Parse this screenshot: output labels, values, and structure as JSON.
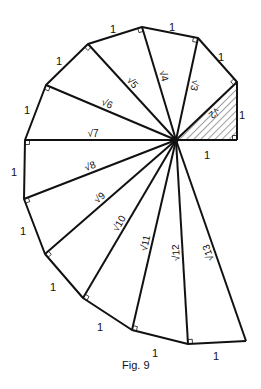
{
  "caption": "Fig. 9",
  "colors": {
    "ink": "#111111",
    "background": "#ffffff"
  },
  "diagram": {
    "type": "spiral-of-theodorus",
    "center": [
      176,
      140
    ],
    "vertices": [
      [
        237,
        140
      ],
      [
        237,
        82
      ],
      [
        198,
        38
      ],
      [
        142,
        27
      ],
      [
        88,
        44
      ],
      [
        46,
        85
      ],
      [
        25,
        140
      ],
      [
        24,
        199
      ],
      [
        45,
        254
      ],
      [
        83,
        298
      ],
      [
        132,
        330
      ],
      [
        188,
        344
      ],
      [
        246,
        341
      ]
    ],
    "hypotenuse_labels": [
      "√2",
      "√3",
      "√4",
      "√5",
      "√6",
      "√7",
      "√8",
      "√9",
      "√10",
      "√11",
      "√12",
      "√13"
    ],
    "unit_labels": [
      {
        "text": "1",
        "x": 207,
        "y": 156
      },
      {
        "text": "1",
        "x": 242,
        "y": 116
      },
      {
        "text": "1",
        "x": 221,
        "y": 58
      },
      {
        "text": "1",
        "x": 172,
        "y": 28
      },
      {
        "text": "1",
        "x": 113,
        "y": 30
      },
      {
        "text": "1",
        "x": 59,
        "y": 62
      },
      {
        "text": "1",
        "x": 27,
        "y": 111
      },
      {
        "text": "1",
        "x": 14,
        "y": 173
      },
      {
        "text": "1",
        "x": 23,
        "y": 232
      },
      {
        "text": "1",
        "x": 53,
        "y": 288
      },
      {
        "text": "1",
        "x": 100,
        "y": 328
      },
      {
        "text": "1",
        "x": 155,
        "y": 354
      },
      {
        "text": "1",
        "x": 216,
        "y": 357
      }
    ],
    "shaded_triangle": "first (legs 1, 1; hypotenuse √2)"
  }
}
